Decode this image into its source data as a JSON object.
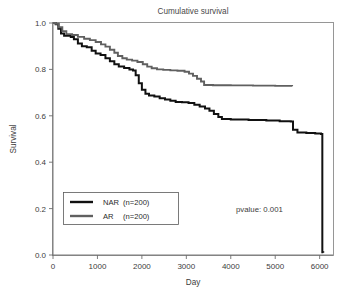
{
  "chart_data": {
    "type": "line",
    "title": "Cumulative survival",
    "xlabel": "Day",
    "ylabel": "Survival",
    "xlim": [
      0,
      6300
    ],
    "ylim": [
      0.0,
      1.0
    ],
    "grid": false,
    "legend_position": "lower-left",
    "annotations": [
      {
        "name": "pvalue",
        "text": "pvalue: 0.001",
        "x": 4100,
        "y": 0.21
      }
    ],
    "xticks": [
      0,
      1000,
      2000,
      3000,
      4000,
      5000,
      6000
    ],
    "xtick_labels": [
      "0",
      "1000",
      "2000",
      "3000",
      "4000",
      "5000",
      "6000"
    ],
    "yticks": [
      0.0,
      0.2,
      0.4,
      0.6,
      0.8,
      1.0
    ],
    "ytick_labels": [
      "0.0",
      "0.2",
      "0.4",
      "0.6",
      "0.8",
      "1.0"
    ],
    "series": [
      {
        "name": "NAR  (n=200)",
        "label": "NAR",
        "count": "(n=200)",
        "color": "#111111",
        "width": 2.0,
        "step": "post",
        "points": [
          [
            0,
            1.0
          ],
          [
            60,
            0.995
          ],
          [
            120,
            0.975
          ],
          [
            180,
            0.955
          ],
          [
            250,
            0.945
          ],
          [
            400,
            0.94
          ],
          [
            470,
            0.93
          ],
          [
            560,
            0.912
          ],
          [
            650,
            0.9
          ],
          [
            760,
            0.895
          ],
          [
            870,
            0.88
          ],
          [
            960,
            0.868
          ],
          [
            1070,
            0.862
          ],
          [
            1180,
            0.848
          ],
          [
            1280,
            0.835
          ],
          [
            1380,
            0.822
          ],
          [
            1480,
            0.812
          ],
          [
            1600,
            0.806
          ],
          [
            1720,
            0.8
          ],
          [
            1800,
            0.795
          ],
          [
            1860,
            0.775
          ],
          [
            1930,
            0.74
          ],
          [
            2000,
            0.712
          ],
          [
            2080,
            0.695
          ],
          [
            2160,
            0.688
          ],
          [
            2280,
            0.683
          ],
          [
            2400,
            0.676
          ],
          [
            2520,
            0.67
          ],
          [
            2640,
            0.665
          ],
          [
            2760,
            0.66
          ],
          [
            2900,
            0.658
          ],
          [
            3050,
            0.655
          ],
          [
            3180,
            0.648
          ],
          [
            3300,
            0.64
          ],
          [
            3420,
            0.632
          ],
          [
            3520,
            0.622
          ],
          [
            3620,
            0.608
          ],
          [
            3720,
            0.595
          ],
          [
            3800,
            0.586
          ],
          [
            4000,
            0.584
          ],
          [
            4400,
            0.582
          ],
          [
            4800,
            0.58
          ],
          [
            5100,
            0.577
          ],
          [
            5350,
            0.575
          ],
          [
            5400,
            0.54
          ],
          [
            5500,
            0.528
          ],
          [
            5700,
            0.526
          ],
          [
            5900,
            0.524
          ],
          [
            6030,
            0.522
          ],
          [
            6060,
            0.012
          ],
          [
            6080,
            0.01
          ]
        ]
      },
      {
        "name": "AR   (n=200)",
        "label": "AR",
        "count": "(n=200)",
        "color": "#606060",
        "width": 1.9,
        "step": "post",
        "points": [
          [
            0,
            1.0
          ],
          [
            60,
            0.997
          ],
          [
            130,
            0.982
          ],
          [
            210,
            0.965
          ],
          [
            300,
            0.952
          ],
          [
            430,
            0.948
          ],
          [
            560,
            0.94
          ],
          [
            700,
            0.932
          ],
          [
            830,
            0.926
          ],
          [
            960,
            0.918
          ],
          [
            1080,
            0.908
          ],
          [
            1180,
            0.898
          ],
          [
            1280,
            0.885
          ],
          [
            1380,
            0.872
          ],
          [
            1460,
            0.858
          ],
          [
            1560,
            0.848
          ],
          [
            1660,
            0.842
          ],
          [
            1780,
            0.838
          ],
          [
            1900,
            0.832
          ],
          [
            2020,
            0.822
          ],
          [
            2120,
            0.812
          ],
          [
            2220,
            0.805
          ],
          [
            2340,
            0.8
          ],
          [
            2480,
            0.798
          ],
          [
            2640,
            0.796
          ],
          [
            2800,
            0.794
          ],
          [
            2960,
            0.79
          ],
          [
            3060,
            0.782
          ],
          [
            3150,
            0.772
          ],
          [
            3240,
            0.76
          ],
          [
            3330,
            0.748
          ],
          [
            3400,
            0.733
          ],
          [
            3600,
            0.732
          ],
          [
            4000,
            0.731
          ],
          [
            4500,
            0.73
          ],
          [
            5000,
            0.729
          ],
          [
            5380,
            0.727
          ]
        ]
      }
    ]
  },
  "legend": {
    "entries": [
      {
        "label": "NAR",
        "count": "(n=200)",
        "color": "#111111"
      },
      {
        "label": "AR",
        "count": "(n=200)",
        "color": "#606060"
      }
    ]
  }
}
